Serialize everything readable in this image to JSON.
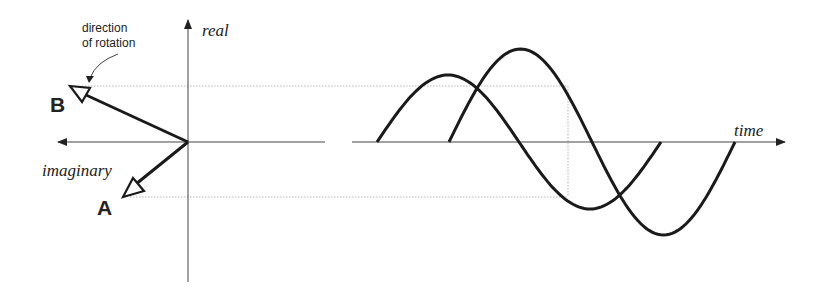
{
  "phasor_diagram": {
    "axis_real_label": "real",
    "axis_imaginary_label": "imaginary",
    "annotation_line1": "direction",
    "annotation_line2": "of rotation",
    "phasor_a_label": "A",
    "phasor_b_label": "B"
  },
  "waveform": {
    "axis_time_label": "time",
    "waves": [
      {
        "name": "wave-A",
        "start_x": 377,
        "amplitude": 67,
        "period": 284
      },
      {
        "name": "wave-B",
        "start_x": 449,
        "amplitude": 93,
        "period": 286
      }
    ]
  },
  "colors": {
    "stroke": "#1a1a1a",
    "axis": "#444444",
    "guide": "#b8b8b8"
  }
}
